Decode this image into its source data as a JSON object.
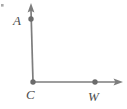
{
  "figure": {
    "type": "geometry-diagram",
    "background_color": "#ffffff",
    "stroke_color": "#7d7d7d",
    "point_color": "#6b6b6b",
    "label_color": "#4c4c4c",
    "artifact_color": "#8c8c8c",
    "labels": {
      "a": "A",
      "c": "C",
      "w": "W"
    },
    "points": [
      {
        "name": "A",
        "label": "A",
        "x": 31,
        "y": 19
      },
      {
        "name": "C",
        "label": "C",
        "x": 33,
        "y": 82
      },
      {
        "name": "W",
        "label": "W",
        "x": 95,
        "y": 82
      }
    ],
    "rays": [
      {
        "name": "ray-CA",
        "from": "C",
        "through": "A",
        "direction": "up",
        "arrow_tip": {
          "x": 31,
          "y": 4
        }
      },
      {
        "name": "ray-CW",
        "from": "C",
        "through": "W",
        "direction": "right",
        "arrow_tip": {
          "x": 123,
          "y": 82
        }
      }
    ],
    "angle": {
      "vertex": "C",
      "measure_degrees": 90,
      "name": "ACW"
    }
  }
}
